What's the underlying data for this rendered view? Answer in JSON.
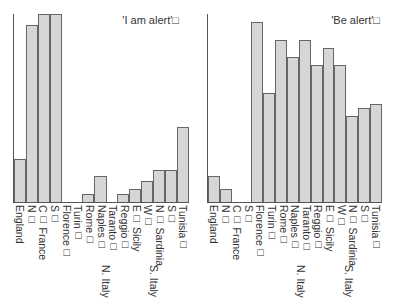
{
  "chart_data": [
    {
      "type": "bar",
      "title": "'I am alert'",
      "categories": [
        "England",
        "N",
        "C France",
        "S",
        "Florence",
        "Turin",
        "Rome",
        "Naples",
        "Taranto",
        "Reggio",
        "E Sicily",
        "W",
        "N Sardinia",
        "S",
        "Tunisia"
      ],
      "values": [
        23,
        94,
        100,
        100,
        0,
        0,
        4,
        14,
        0,
        4,
        7,
        11,
        17,
        17,
        40
      ],
      "xlabel": "",
      "ylabel": "",
      "ylim": [
        0,
        100
      ],
      "grid": false,
      "group_labels": [
        {
          "label": "France",
          "spans": [
            "N",
            "C France",
            "S"
          ]
        },
        {
          "label": "N. Italy",
          "spans": [
            "Florence",
            "Turin",
            "Rome"
          ]
        },
        {
          "label": "S. Italy",
          "spans": [
            "Naples",
            "Taranto",
            "Reggio"
          ]
        },
        {
          "label": "Sicily",
          "spans": [
            "E",
            "W"
          ]
        },
        {
          "label": "Sardinia",
          "spans": [
            "N",
            "S"
          ]
        }
      ]
    },
    {
      "type": "bar",
      "title": "'Be alert'",
      "categories": [
        "England",
        "N",
        "C France",
        "S",
        "Florence",
        "Turin",
        "Rome",
        "Naples",
        "Taranto",
        "Reggio",
        "E Sicily",
        "W",
        "N Sardinia",
        "S",
        "Tunisia"
      ],
      "values": [
        14,
        7,
        0,
        0,
        96,
        58,
        86,
        77,
        86,
        73,
        82,
        73,
        46,
        50,
        52
      ],
      "xlabel": "",
      "ylabel": "",
      "ylim": [
        0,
        100
      ],
      "grid": false,
      "group_labels": [
        {
          "label": "France",
          "spans": [
            "N",
            "C France",
            "S"
          ]
        },
        {
          "label": "N. Italy",
          "spans": [
            "Florence",
            "Turin",
            "Rome"
          ]
        },
        {
          "label": "S. Italy",
          "spans": [
            "Naples",
            "Taranto",
            "Reggio"
          ]
        },
        {
          "label": "Sicily",
          "spans": [
            "E",
            "W"
          ]
        },
        {
          "label": "Sardinia",
          "spans": [
            "N",
            "S"
          ]
        }
      ]
    }
  ],
  "left": {
    "title": "'I am alert'□",
    "labels": [
      "England",
      "N□",
      "C□ France",
      "S□",
      "Florence□",
      "Turin□",
      "Rome□",
      "Naples□",
      "Taranto□",
      "Reggio□",
      "E□ Sicily",
      "W□",
      "N□ Sardinia",
      "S□",
      "Tunisia□"
    ],
    "group_n_italy": "N. Italy",
    "group_s_italy": "S. Italy"
  },
  "right": {
    "title": "'Be alert'□",
    "labels": [
      "England",
      "N□",
      "C□ France",
      "S□",
      "Florence□",
      "Turin□",
      "Rome□",
      "Naples□",
      "Taranto□",
      "Reggio□",
      "E□ Sicily",
      "W□",
      "N□ Sardinia",
      "S□",
      "Tunisia□"
    ],
    "group_n_italy": "N. Italy",
    "group_s_italy": "S. Italy"
  },
  "colors": {
    "bar_fill": "#d6d6d6",
    "bar_edge": "#666666",
    "axis": "#555555"
  }
}
